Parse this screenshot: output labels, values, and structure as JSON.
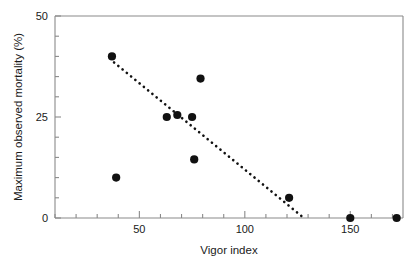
{
  "chart_data": {
    "type": "scatter",
    "title": "",
    "xlabel": "Vigor index",
    "ylabel": "Maximum observed mortality (%)",
    "xlim": [
      10,
      175
    ],
    "ylim": [
      0,
      50
    ],
    "xticks": [
      50,
      100,
      150
    ],
    "xtick_labels": [
      "50",
      "100",
      "150"
    ],
    "yticks": [
      0,
      25,
      50
    ],
    "ytick_labels": [
      "0",
      "25",
      "50"
    ],
    "x_minor_step": 10,
    "y_minor_step": 5,
    "grid": false,
    "legend": null,
    "points": [
      {
        "x": 37,
        "y": 40
      },
      {
        "x": 39,
        "y": 10
      },
      {
        "x": 63,
        "y": 25
      },
      {
        "x": 68,
        "y": 25.5
      },
      {
        "x": 75,
        "y": 25
      },
      {
        "x": 76,
        "y": 14.5
      },
      {
        "x": 79,
        "y": 34.5
      },
      {
        "x": 121,
        "y": 5
      },
      {
        "x": 150,
        "y": 0
      },
      {
        "x": 172,
        "y": 0
      }
    ],
    "trendline": {
      "style": "dotted",
      "x_start": 38,
      "y_start": 38.5,
      "x_end": 128,
      "y_end": 0
    },
    "marker": {
      "shape": "circle",
      "color": "#111111",
      "size": 5.6
    }
  },
  "axes": {
    "line_color": "#8a8a8a",
    "frame": "box"
  }
}
